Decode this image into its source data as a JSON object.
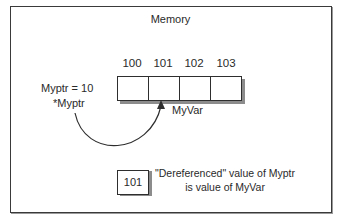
{
  "diagram": {
    "title": "Memory",
    "addresses": [
      "100",
      "101",
      "102",
      "103"
    ],
    "pointer_assignment": "Myptr = 10",
    "dereference_label": "*Myptr",
    "variable_label": "MyVar",
    "value_box": "101",
    "note_line1": "\"Dereferenced\" value of Myptr",
    "note_line2": "is value of MyVar",
    "colors": {
      "border": "#2e2e2e",
      "shadow": "#8c8c8c",
      "background": "#ffffff"
    }
  }
}
